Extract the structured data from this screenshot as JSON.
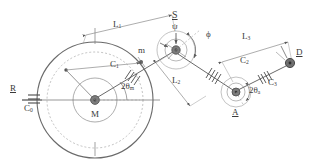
{
  "diagram": {
    "canvas": {
      "width": 313,
      "height": 166,
      "background": "#ffffff"
    },
    "stroke_color": "#5a5a5a",
    "text_color": "#3a3a3a",
    "labels": {
      "ground_support": "R",
      "damper_0": "C",
      "damper_0_sub": "0",
      "disc_center": "M",
      "mass_point": "m",
      "damper_1": "C",
      "damper_1_sub": "1",
      "link_1": "L",
      "link_1_sub": "1",
      "link_2": "L",
      "link_2_sub": "2",
      "link_3": "L",
      "link_3_sub": "3",
      "joint_s": "S",
      "angle_psi": "ψ",
      "angle_phi": "ϕ",
      "damper_2": "C",
      "damper_2_sub": "2",
      "damper_3": "C",
      "damper_3_sub": "3",
      "joint_a": "A",
      "joint_d": "D",
      "angle_theta_m": "2θ",
      "angle_theta_m_sub": "m",
      "angle_theta_a": "2θ",
      "angle_theta_a_sub": "a"
    }
  }
}
